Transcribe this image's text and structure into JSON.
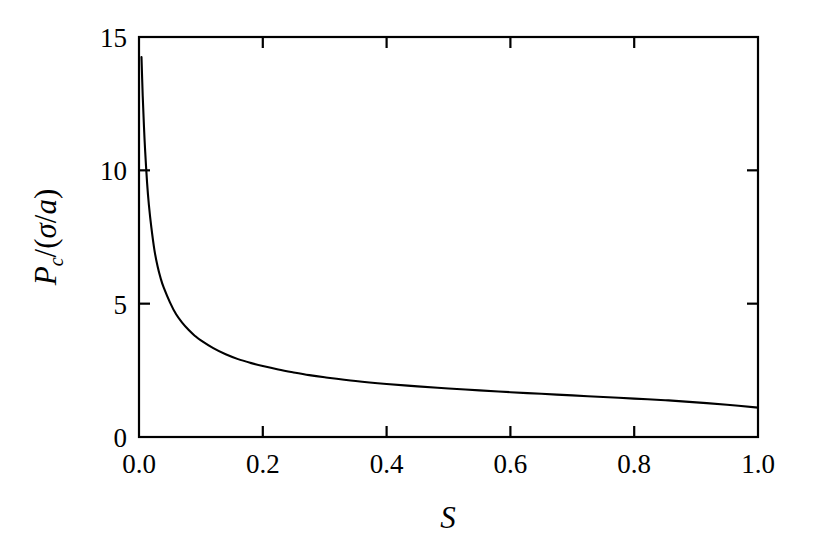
{
  "figure": {
    "background_color": "#ffffff",
    "foreground_color": "#000000"
  },
  "chart_data": {
    "type": "line",
    "title": "",
    "subtitle": "",
    "xlabel": "S",
    "ylabel": "P_c/(sigma/a)",
    "ylabel_parts": {
      "main": "P",
      "subscript": "c",
      "divider": "/(",
      "sigma": "σ",
      "slash": "/",
      "a": "a",
      "close": ")"
    },
    "xlim": [
      0.0,
      1.0
    ],
    "ylim": [
      0.0,
      15.0
    ],
    "xticks": [
      0.0,
      0.2,
      0.4,
      0.6,
      0.8,
      1.0
    ],
    "xtick_labels": [
      "0.0",
      "0.2",
      "0.4",
      "0.6",
      "0.8",
      "1.0"
    ],
    "yticks": [
      0,
      5,
      10,
      15
    ],
    "ytick_labels": [
      "0",
      "5",
      "10",
      "15"
    ],
    "xminorticks": [],
    "yminorticks": [],
    "grid": false,
    "legend": false,
    "legend_position": "none",
    "tick_direction": "in",
    "frame": "full-box",
    "series": [
      {
        "name": "Pc over sigma-a",
        "color": "#000000",
        "x": [
          0.004,
          0.006,
          0.008,
          0.01,
          0.013,
          0.016,
          0.02,
          0.025,
          0.03,
          0.035,
          0.04,
          0.05,
          0.06,
          0.07,
          0.08,
          0.09,
          0.1,
          0.12,
          0.14,
          0.16,
          0.18,
          0.2,
          0.225,
          0.25,
          0.275,
          0.3,
          0.35,
          0.4,
          0.45,
          0.5,
          0.55,
          0.6,
          0.65,
          0.7,
          0.75,
          0.8,
          0.85,
          0.9,
          0.95,
          1.0
        ],
        "y": [
          14.25,
          12.8,
          11.65,
          10.7,
          9.55,
          8.7,
          7.85,
          7.0,
          6.4,
          5.95,
          5.6,
          5.05,
          4.6,
          4.28,
          4.02,
          3.8,
          3.62,
          3.33,
          3.1,
          2.92,
          2.78,
          2.66,
          2.53,
          2.42,
          2.32,
          2.24,
          2.1,
          1.99,
          1.9,
          1.82,
          1.75,
          1.68,
          1.62,
          1.56,
          1.5,
          1.44,
          1.38,
          1.3,
          1.21,
          1.1
        ]
      }
    ],
    "annotations": []
  }
}
